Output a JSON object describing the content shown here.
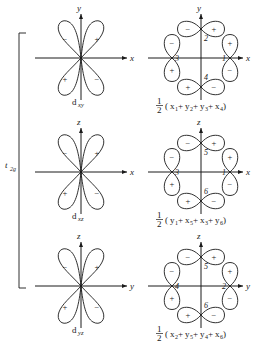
{
  "figure": {
    "group_label": {
      "base": "t",
      "sub": "2g"
    },
    "rows": [
      {
        "orbital": {
          "base": "d",
          "sub": "xy"
        },
        "axes": {
          "vertical": "y",
          "horizontal": "x"
        },
        "signs_orbital": {
          "upper_left": "−",
          "upper_right": "+",
          "lower_left": "+",
          "lower_right": "−"
        },
        "ligand_numbers": {
          "top": "2",
          "left": "3",
          "right": "1",
          "bottom": "4"
        },
        "signs_ligand": {
          "top_left": "−",
          "top_right": "+",
          "left_upper": "−",
          "right_upper": "+",
          "left_lower": "+",
          "right_lower": "−",
          "bottom_left": "+",
          "bottom_right": "−"
        },
        "combination": {
          "coefficient_numerator": "1",
          "coefficient_denominator": "2",
          "terms": [
            {
              "base": "x",
              "sub": "1"
            },
            {
              "base": "y",
              "sub": "2"
            },
            {
              "base": "y",
              "sub": "3"
            },
            {
              "base": "x",
              "sub": "4"
            }
          ]
        }
      },
      {
        "orbital": {
          "base": "d",
          "sub": "xz"
        },
        "axes": {
          "vertical": "z",
          "horizontal": "x"
        },
        "signs_orbital": {
          "upper_left": "−",
          "upper_right": "+",
          "lower_left": "+",
          "lower_right": "−"
        },
        "ligand_numbers": {
          "top": "5",
          "left": "3",
          "right": "1",
          "bottom": "6"
        },
        "signs_ligand": {
          "top_left": "−",
          "top_right": "+",
          "left_upper": "−",
          "right_upper": "+",
          "left_lower": "+",
          "right_lower": "−",
          "bottom_left": "+",
          "bottom_right": "−"
        },
        "combination": {
          "coefficient_numerator": "1",
          "coefficient_denominator": "2",
          "terms": [
            {
              "base": "y",
              "sub": "1"
            },
            {
              "base": "x",
              "sub": "5"
            },
            {
              "base": "x",
              "sub": "3"
            },
            {
              "base": "y",
              "sub": "6"
            }
          ]
        }
      },
      {
        "orbital": {
          "base": "d",
          "sub": "yz"
        },
        "axes": {
          "vertical": "z",
          "horizontal": "y"
        },
        "signs_orbital": {
          "upper_left": "−",
          "upper_right": "+",
          "lower_left": "+",
          "lower_right": "−"
        },
        "ligand_numbers": {
          "top": "5",
          "left": "4",
          "right": "2",
          "bottom": "6"
        },
        "signs_ligand": {
          "top_left": "−",
          "top_right": "+",
          "left_upper": "−",
          "right_upper": "+",
          "left_lower": "+",
          "right_lower": "−",
          "bottom_left": "+",
          "bottom_right": "−"
        },
        "combination": {
          "coefficient_numerator": "1",
          "coefficient_denominator": "2",
          "terms": [
            {
              "base": "x",
              "sub": "2"
            },
            {
              "base": "y",
              "sub": "5"
            },
            {
              "base": "y",
              "sub": "4"
            },
            {
              "base": "x",
              "sub": "6"
            }
          ]
        }
      }
    ],
    "plus_sign": "+",
    "colors": {
      "ink": "#1a1a1a",
      "background": "#ffffff",
      "bleed": "#c9c9c9"
    }
  }
}
